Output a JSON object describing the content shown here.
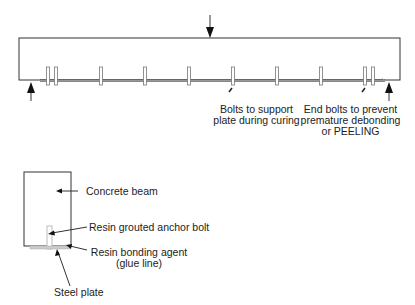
{
  "diagram": {
    "elevation_view": {
      "beam": {
        "x": 19,
        "y": 38,
        "width": 381,
        "height": 42
      },
      "plate_line_y": 80,
      "bolt_x_positions": [
        48,
        56,
        101,
        145,
        189,
        233,
        277,
        321,
        365,
        373
      ],
      "load_arrow": {
        "x": 210,
        "direction": "down"
      },
      "support_arrows": [
        {
          "x": 31,
          "direction": "up"
        },
        {
          "x": 389,
          "direction": "up"
        }
      ],
      "labels": {
        "support_bolts": [
          "Bolts to support",
          "plate during curing"
        ],
        "end_bolts": [
          "End bolts to prevent",
          "premature debonding",
          "or PEELING"
        ]
      }
    },
    "section_view": {
      "labels": {
        "concrete_beam": "Concrete beam",
        "anchor_bolt": "Resin grouted anchor bolt",
        "bonding_agent": [
          "Resin bonding agent",
          "(glue line)"
        ],
        "steel_plate": "Steel plate"
      }
    },
    "colors": {
      "line": "#333333",
      "plate": "#aaaaaa",
      "bolt_fill": "#ffffff"
    }
  }
}
